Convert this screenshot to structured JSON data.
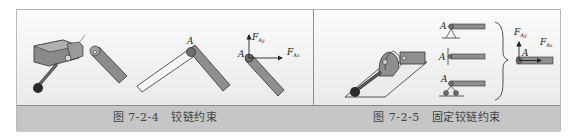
{
  "figures": [
    {
      "number": "图 7-2-4",
      "title": "铰链约束",
      "labels": {
        "pin_point": "A",
        "force_y": "F",
        "force_y_sub": "Ay",
        "force_x": "F",
        "force_x_sub": "Ax"
      }
    },
    {
      "number": "图 7-2-5",
      "title": "固定铰链约束",
      "labels": {
        "support_a1": "A",
        "support_a2": "A",
        "support_a3": "A",
        "pin_point": "A",
        "force_y": "F",
        "force_y_sub": "Ay",
        "force_x": "F",
        "force_x_sub": "Ax"
      }
    }
  ],
  "colors": {
    "frame_bg": "#ececec",
    "caption_band": "#c6c6c6",
    "member_fill": "#8d8d8d",
    "member_light": "#f4f4f4",
    "stroke": "#333333"
  }
}
